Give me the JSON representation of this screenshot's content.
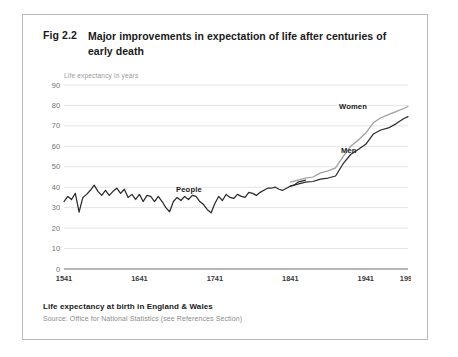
{
  "figure": {
    "number": "Fig 2.2",
    "title": "Major improvements in expectation of life after centuries of early death",
    "y_axis_caption": "Life expectancy in years",
    "footer_title": "Life expectancy at birth in England & Wales",
    "footer_source": "Source: Office for National Statistics (see References Section)"
  },
  "labels": {
    "women": "Women",
    "men": "Men",
    "people": "People"
  },
  "colors": {
    "women_line": "#9e9e9e",
    "men_line": "#2b2b2b",
    "people_line": "#2b2b2b",
    "gridline": "#d8d8d8",
    "axis": "#8a8a8a",
    "card_border": "#b9b9b9",
    "text": "#1a1a1a",
    "muted_text": "#9a9a9a"
  },
  "chart_data": {
    "type": "line",
    "title": "Major improvements in expectation of life after centuries of early death",
    "subtitle": "Life expectancy at birth in England & Wales",
    "xlabel": "",
    "ylabel": "Life expectancy in years",
    "xlim": [
      1541,
      1997
    ],
    "ylim": [
      0,
      90
    ],
    "yticks": [
      0,
      10,
      20,
      30,
      40,
      50,
      60,
      70,
      80,
      90
    ],
    "xticks": [
      1541,
      1641,
      1741,
      1841,
      1941,
      1997
    ],
    "grid": "horizontal",
    "legend": "inline-annotations",
    "annotations": [
      {
        "text": "People",
        "x": 1740,
        "y": 44
      },
      {
        "text": "Women",
        "x": 1960,
        "y": 84
      },
      {
        "text": "Men",
        "x": 1966,
        "y": 64
      }
    ],
    "series": [
      {
        "name": "People",
        "color": "#2b2b2b",
        "x": [
          1541,
          1546,
          1551,
          1556,
          1561,
          1566,
          1571,
          1576,
          1581,
          1586,
          1591,
          1596,
          1601,
          1606,
          1611,
          1616,
          1621,
          1626,
          1631,
          1636,
          1641,
          1646,
          1651,
          1656,
          1661,
          1666,
          1671,
          1676,
          1681,
          1686,
          1691,
          1696,
          1701,
          1706,
          1711,
          1716,
          1721,
          1726,
          1731,
          1736,
          1741,
          1746,
          1751,
          1756,
          1761,
          1766,
          1771,
          1776,
          1781,
          1786,
          1791,
          1796,
          1801,
          1806,
          1811,
          1816,
          1821,
          1826,
          1831,
          1836,
          1841,
          1846,
          1851,
          1856,
          1861
        ],
        "values": [
          33.0,
          35.5,
          34.0,
          37.0,
          27.8,
          35.0,
          36.5,
          38.5,
          41.0,
          38.0,
          36.0,
          38.5,
          36.0,
          38.0,
          39.5,
          37.0,
          39.0,
          35.0,
          36.5,
          34.0,
          36.5,
          33.0,
          36.0,
          35.5,
          33.0,
          35.5,
          33.0,
          30.0,
          28.0,
          33.0,
          35.0,
          33.5,
          35.5,
          34.0,
          36.0,
          35.5,
          33.0,
          31.5,
          29.0,
          27.5,
          32.0,
          35.5,
          33.5,
          36.5,
          35.0,
          34.5,
          36.5,
          35.5,
          35.0,
          37.5,
          37.0,
          36.0,
          37.5,
          38.5,
          39.5,
          39.5,
          40.0,
          39.0,
          38.5,
          39.5,
          40.5,
          41.0,
          42.5,
          43.0,
          43.5
        ]
      },
      {
        "name": "Women",
        "color": "#9e9e9e",
        "x": [
          1841,
          1851,
          1861,
          1871,
          1881,
          1891,
          1901,
          1911,
          1921,
          1931,
          1941,
          1951,
          1961,
          1971,
          1981,
          1991,
          1997
        ],
        "values": [
          42.5,
          43.5,
          44.5,
          45.0,
          47.0,
          48.0,
          49.5,
          55.0,
          60.0,
          63.0,
          66.5,
          71.5,
          74.0,
          75.5,
          77.0,
          78.5,
          79.5
        ]
      },
      {
        "name": "Men",
        "color": "#2b2b2b",
        "x": [
          1841,
          1851,
          1861,
          1871,
          1881,
          1891,
          1901,
          1911,
          1921,
          1931,
          1941,
          1951,
          1961,
          1971,
          1981,
          1991,
          1997
        ],
        "values": [
          40.5,
          41.5,
          42.5,
          42.8,
          44.0,
          44.5,
          45.5,
          51.5,
          56.0,
          58.5,
          61.0,
          66.0,
          68.0,
          69.0,
          71.0,
          73.5,
          74.5
        ]
      }
    ]
  }
}
